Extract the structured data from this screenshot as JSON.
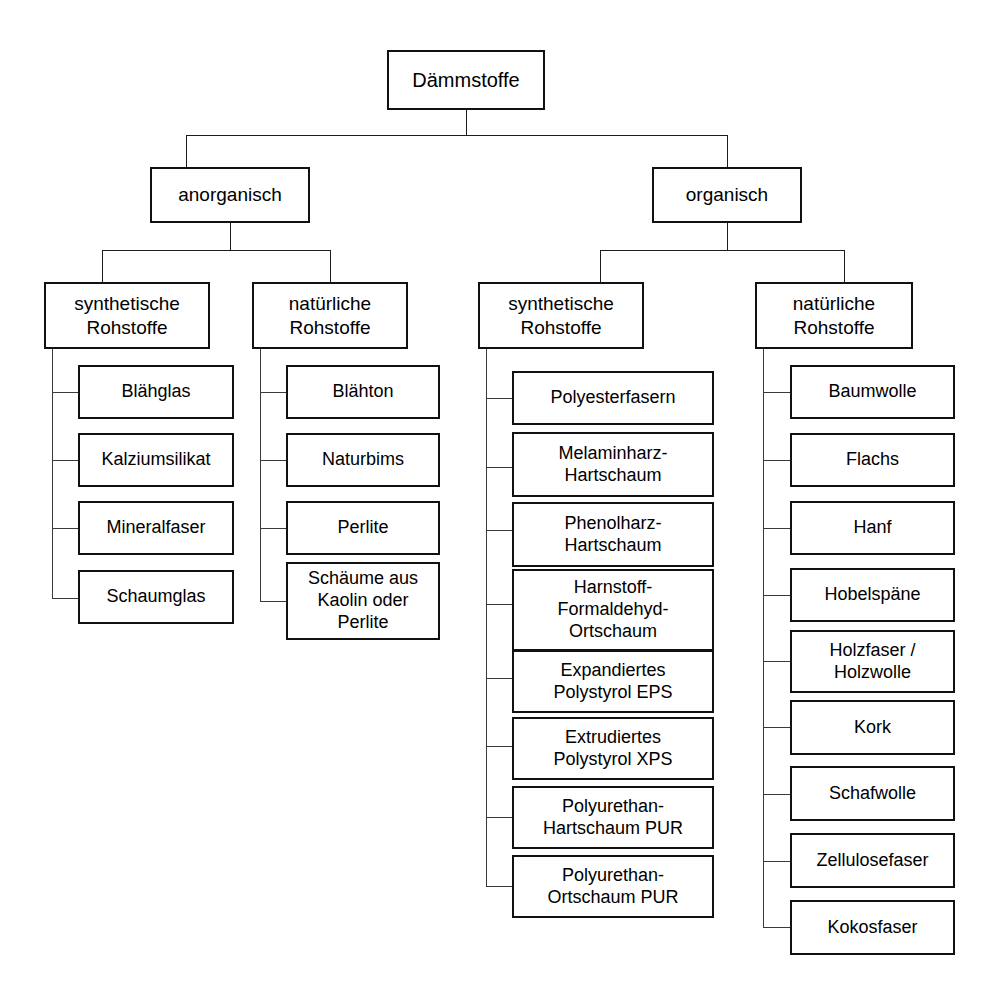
{
  "diagram": {
    "title": "Dämmstoffe",
    "type": "hierarchy-tree",
    "root": {
      "label": "Dämmstoffe"
    },
    "level2": [
      {
        "id": "anorganisch",
        "label": "anorganisch"
      },
      {
        "id": "organisch",
        "label": "organisch"
      }
    ],
    "level3": [
      {
        "id": "anorg-synth",
        "parent": "anorganisch",
        "label": "synthetische\nRohstoffe"
      },
      {
        "id": "anorg-nat",
        "parent": "anorganisch",
        "label": "natürliche\nRohstoffe"
      },
      {
        "id": "org-synth",
        "parent": "organisch",
        "label": "synthetische\nRohstoffe"
      },
      {
        "id": "org-nat",
        "parent": "organisch",
        "label": "natürliche\nRohstoffe"
      }
    ],
    "columns": [
      {
        "id": "anorg-synth-items",
        "items": [
          {
            "label": "Blähglas"
          },
          {
            "label": "Kalziumsilikat"
          },
          {
            "label": "Mineralfaser"
          },
          {
            "label": "Schaumglas"
          }
        ]
      },
      {
        "id": "anorg-nat-items",
        "items": [
          {
            "label": "Blähton"
          },
          {
            "label": "Naturbims"
          },
          {
            "label": "Perlite"
          },
          {
            "label": "Schäume aus\nKaolin oder\nPerlite"
          }
        ]
      },
      {
        "id": "org-synth-items",
        "items": [
          {
            "label": "Polyesterfasern"
          },
          {
            "label": "Melaminharz-\nHartschaum"
          },
          {
            "label": "Phenolharz-\nHartschaum"
          },
          {
            "label": "Harnstoff-\nFormaldehyd-\nOrtschaum"
          },
          {
            "label": "Expandiertes\nPolystyrol EPS"
          },
          {
            "label": "Extrudiertes\nPolystyrol XPS"
          },
          {
            "label": "Polyurethan-\nHartschaum PUR"
          },
          {
            "label": "Polyurethan-\nOrtschaum PUR"
          }
        ]
      },
      {
        "id": "org-nat-items",
        "items": [
          {
            "label": "Baumwolle"
          },
          {
            "label": "Flachs"
          },
          {
            "label": "Hanf"
          },
          {
            "label": "Hobelspäne"
          },
          {
            "label": "Holzfaser /\nHolzwolle"
          },
          {
            "label": "Kork"
          },
          {
            "label": "Schafwolle"
          },
          {
            "label": "Zellulosefaser"
          },
          {
            "label": "Kokosfaser"
          }
        ]
      }
    ],
    "colors": {
      "border": "#111111",
      "connector": "#1c1c1c",
      "background": "#ffffff",
      "text": "#000000"
    }
  }
}
